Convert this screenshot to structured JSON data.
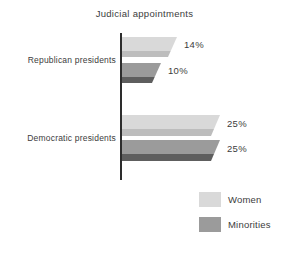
{
  "title": "Judicial appointments",
  "colors": {
    "background": "#ffffff",
    "axis": "#2d2d2d",
    "text": "#3c3c3c",
    "women_main": "#d9d9d9",
    "women_shadow": "#bdbdbd",
    "minorities_main": "#9b9b9b",
    "minorities_shadow": "#5e5e5e"
  },
  "legend": {
    "items": [
      {
        "label": "Women",
        "color": "#d9d9d9"
      },
      {
        "label": "Minorities",
        "color": "#9b9b9b"
      }
    ]
  },
  "chart_data": {
    "type": "bar",
    "orientation": "horizontal",
    "title": "Judicial appointments",
    "categories": [
      "Republican presidents",
      "Democratic presidents"
    ],
    "series": [
      {
        "name": "Women",
        "values": [
          14,
          25
        ]
      },
      {
        "name": "Minorities",
        "values": [
          10,
          25
        ]
      }
    ],
    "value_labels": {
      "women_republican": "14%",
      "minorities_republican": "10%",
      "women_democratic": "25%",
      "minorities_democratic": "25%"
    },
    "xlim": [
      0,
      25
    ],
    "grid": false,
    "legend_position": "bottom-right"
  }
}
